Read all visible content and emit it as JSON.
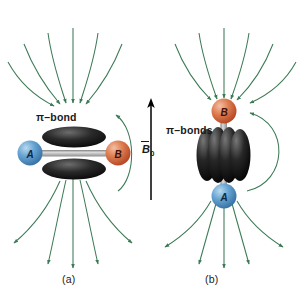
{
  "figure": {
    "background_color": "#ffffff",
    "panels": [
      {
        "id": "a",
        "caption": "(a)",
        "bond_label": "π–bond",
        "orientation": "perpendicular",
        "atoms": [
          {
            "label": "A",
            "color": "#4a8ec2",
            "position": "left"
          },
          {
            "label": "B",
            "color": "#d9663c",
            "position": "right"
          }
        ],
        "lobes": 2,
        "lobe_color": "#141414",
        "lobe_orientation": "horizontal"
      },
      {
        "id": "b",
        "caption": "(b)",
        "bond_label": "π–bonds",
        "orientation": "parallel",
        "atoms": [
          {
            "label": "B",
            "color": "#d9663c",
            "position": "top"
          },
          {
            "label": "A",
            "color": "#4a8ec2",
            "position": "bottom"
          }
        ],
        "lobes": 4,
        "lobe_color": "#141414",
        "lobe_orientation": "vertical"
      }
    ],
    "field": {
      "arrow_label_symbol": "B",
      "arrow_label_subscript": "0",
      "arrow_color": "#000000",
      "arrow_direction": "up",
      "line_color": "#3c7a55",
      "line_label": "induced magnetic field lines"
    },
    "bond_stick_color": "#9a9a9a"
  }
}
